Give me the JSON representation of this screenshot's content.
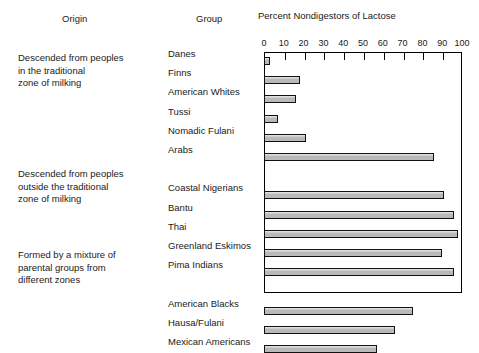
{
  "headers": {
    "origin": "Origin",
    "group": "Group",
    "axis_title": "Percent Nondigestors of Lactose"
  },
  "origin_blocks": [
    {
      "lines": [
        "Descended from peoples",
        "in the traditional",
        "zone of milking"
      ]
    },
    {
      "lines": [
        "Descended from peoples",
        "outside the traditional",
        "zone of milking"
      ]
    },
    {
      "lines": [
        "Formed by a mixture of",
        "parental groups from",
        "different zones"
      ]
    }
  ],
  "axis": {
    "ticks": [
      0,
      10,
      20,
      30,
      40,
      50,
      60,
      70,
      80,
      90,
      100
    ],
    "min": 0,
    "max": 100
  },
  "chart_data": {
    "type": "bar",
    "orientation": "horizontal",
    "title": "Percent Nondigestors of Lactose",
    "xlabel": "Percent Nondigestors of Lactose",
    "ylabel": "Group",
    "xlim": [
      0,
      100
    ],
    "grid": false,
    "legend": null,
    "bar_color": "#b9b9b9",
    "bar_edge_color": "#111111",
    "categories": [
      "Danes",
      "Finns",
      "American Whites",
      "Tussi",
      "Nomadic Fulani",
      "Arabs",
      "Coastal Nigerians",
      "Bantu",
      "Thai",
      "Greenland Eskimos",
      "Pima Indians",
      "American Blacks",
      "Hausa/Fulani",
      "Mexican Americans"
    ],
    "values": [
      3,
      18,
      16,
      7,
      21,
      86,
      91,
      96,
      98,
      90,
      96,
      75,
      66,
      57
    ],
    "groups": [
      {
        "origin": "Descended from peoples in the traditional zone of milking",
        "categories": [
          "Danes",
          "Finns",
          "American Whites",
          "Tussi",
          "Nomadic Fulani",
          "Arabs"
        ],
        "values": [
          3,
          18,
          16,
          7,
          21,
          86
        ]
      },
      {
        "origin": "Descended from peoples outside the traditional zone of milking",
        "categories": [
          "Coastal Nigerians",
          "Bantu",
          "Thai",
          "Greenland Eskimos",
          "Pima Indians"
        ],
        "values": [
          91,
          96,
          98,
          90,
          96
        ]
      },
      {
        "origin": "Formed by a mixture of parental groups from different zones",
        "categories": [
          "American Blacks",
          "Hausa/Fulani",
          "Mexican Americans"
        ],
        "values": [
          75,
          66,
          57
        ]
      }
    ]
  }
}
